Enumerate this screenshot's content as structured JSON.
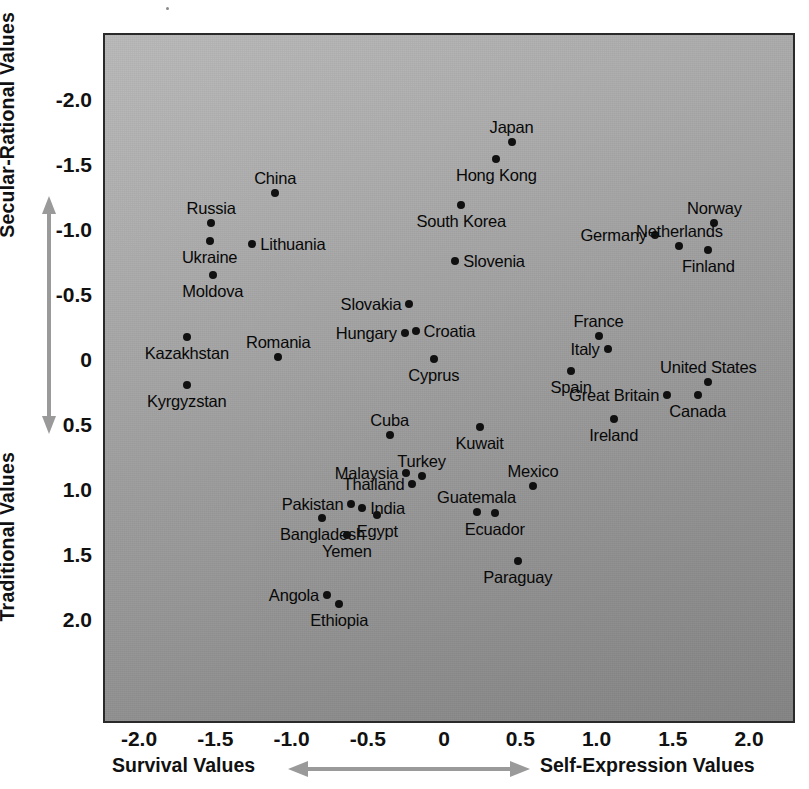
{
  "axes": {
    "y_title_top": "Secular-Rational Values",
    "y_title_bottom": "Traditional Values",
    "x_title_left": "Survival Values",
    "x_title_right": "Self-Expression Values",
    "y_ticks": [
      "2.0",
      "1.5",
      "1.0",
      "0.5",
      "0",
      "-0.5",
      "-1.0",
      "-1.5",
      "-2.0"
    ],
    "x_ticks": [
      "-2.0",
      "-1.5",
      "-1.0",
      "-0.5",
      "0",
      "0.5",
      "1.0",
      "1.5",
      "2.0"
    ]
  },
  "chart_data": {
    "type": "scatter",
    "title": "",
    "xlabel": "Survival Values ↔ Self-Expression Values",
    "ylabel": "Traditional Values ↔ Secular-Rational Values",
    "xlim": [
      -2.27,
      2.27
    ],
    "ylim": [
      -2.22,
      2.22
    ],
    "xticks": [
      -2.0,
      -1.5,
      -1.0,
      -0.5,
      0,
      0.5,
      1.0,
      1.5,
      2.0
    ],
    "yticks": [
      -2.0,
      -1.5,
      -1.0,
      -0.5,
      0,
      0.5,
      1.0,
      1.5,
      2.0
    ],
    "grid": false,
    "legend": null,
    "marker_color": "#101010",
    "plot_background": "#a0a0a0",
    "points": [
      {
        "label": "Japan",
        "x": 0.43,
        "y": 1.69,
        "anchor": "above"
      },
      {
        "label": "Hong Kong",
        "x": 0.33,
        "y": 1.56,
        "anchor": "below"
      },
      {
        "label": "China",
        "x": -1.12,
        "y": 1.3,
        "anchor": "above"
      },
      {
        "label": "South Korea",
        "x": 0.1,
        "y": 1.21,
        "anchor": "below"
      },
      {
        "label": "Norway",
        "x": 1.76,
        "y": 1.07,
        "anchor": "above"
      },
      {
        "label": "Russia",
        "x": -1.54,
        "y": 1.07,
        "anchor": "above"
      },
      {
        "label": "Germany",
        "x": 1.37,
        "y": 0.98,
        "anchor": "left"
      },
      {
        "label": "Ukraine",
        "x": -1.55,
        "y": 0.93,
        "anchor": "below"
      },
      {
        "label": "Netherlands",
        "x": 1.53,
        "y": 0.89,
        "anchor": "above"
      },
      {
        "label": "Lithuania",
        "x": -1.27,
        "y": 0.91,
        "anchor": "right"
      },
      {
        "label": "Finland",
        "x": 1.72,
        "y": 0.86,
        "anchor": "below"
      },
      {
        "label": "Slovenia",
        "x": 0.06,
        "y": 0.78,
        "anchor": "right"
      },
      {
        "label": "Moldova",
        "x": -1.53,
        "y": 0.67,
        "anchor": "below"
      },
      {
        "label": "Slovakia",
        "x": -0.24,
        "y": 0.45,
        "anchor": "left"
      },
      {
        "label": "Croatia",
        "x": -0.2,
        "y": 0.24,
        "anchor": "right"
      },
      {
        "label": "Hungary",
        "x": -0.27,
        "y": 0.22,
        "anchor": "left"
      },
      {
        "label": "France",
        "x": 1.0,
        "y": 0.2,
        "anchor": "above"
      },
      {
        "label": "Kazakhstan",
        "x": -1.7,
        "y": 0.19,
        "anchor": "below"
      },
      {
        "label": "Italy",
        "x": 1.06,
        "y": 0.1,
        "anchor": "left"
      },
      {
        "label": "Romania",
        "x": -1.1,
        "y": 0.04,
        "anchor": "above"
      },
      {
        "label": "Cyprus",
        "x": -0.08,
        "y": 0.02,
        "anchor": "below"
      },
      {
        "label": "Spain",
        "x": 0.82,
        "y": -0.07,
        "anchor": "below"
      },
      {
        "label": "United States",
        "x": 1.72,
        "y": -0.15,
        "anchor": "above"
      },
      {
        "label": "Kyrgyzstan",
        "x": -1.7,
        "y": -0.18,
        "anchor": "below"
      },
      {
        "label": "Great Britain",
        "x": 1.45,
        "y": -0.25,
        "anchor": "left"
      },
      {
        "label": "Canada",
        "x": 1.65,
        "y": -0.25,
        "anchor": "below"
      },
      {
        "label": "Ireland",
        "x": 1.1,
        "y": -0.44,
        "anchor": "below"
      },
      {
        "label": "Kuwait",
        "x": 0.22,
        "y": -0.5,
        "anchor": "below"
      },
      {
        "label": "Cuba",
        "x": -0.37,
        "y": -0.56,
        "anchor": "above"
      },
      {
        "label": "Turkey",
        "x": -0.16,
        "y": -0.88,
        "anchor": "above"
      },
      {
        "label": "Malaysia",
        "x": -0.26,
        "y": -0.85,
        "anchor": "left"
      },
      {
        "label": "Mexico",
        "x": 0.57,
        "y": -0.95,
        "anchor": "above"
      },
      {
        "label": "Thailand",
        "x": -0.22,
        "y": -0.94,
        "anchor": "left"
      },
      {
        "label": "Pakistan",
        "x": -0.62,
        "y": -1.09,
        "anchor": "left"
      },
      {
        "label": "India",
        "x": -0.55,
        "y": -1.12,
        "anchor": "right"
      },
      {
        "label": "Guatemala",
        "x": 0.2,
        "y": -1.15,
        "anchor": "above"
      },
      {
        "label": "Bangladesh",
        "x": -0.81,
        "y": -1.2,
        "anchor": "below"
      },
      {
        "label": "Egypt",
        "x": -0.45,
        "y": -1.18,
        "anchor": "below"
      },
      {
        "label": "Ecuador",
        "x": 0.32,
        "y": -1.16,
        "anchor": "below"
      },
      {
        "label": "Yemen",
        "x": -0.65,
        "y": -1.33,
        "anchor": "below"
      },
      {
        "label": "Paraguay",
        "x": 0.47,
        "y": -1.53,
        "anchor": "below"
      },
      {
        "label": "Angola",
        "x": -0.78,
        "y": -1.79,
        "anchor": "left"
      },
      {
        "label": "Ethiopia",
        "x": -0.7,
        "y": -1.86,
        "anchor": "below"
      }
    ]
  }
}
